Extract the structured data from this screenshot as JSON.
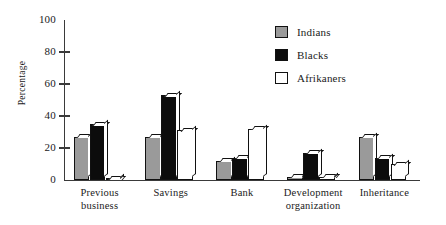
{
  "chart_data": {
    "type": "bar",
    "title": "",
    "xlabel": "",
    "ylabel": "Percentage",
    "ylim": [
      0,
      100
    ],
    "yticks": [
      0,
      20,
      40,
      60,
      80,
      100
    ],
    "grid": false,
    "legend_position": "top-right",
    "categories": [
      "Previous business",
      "Savings",
      "Bank",
      "Development organization",
      "Inheritance"
    ],
    "category_lines": [
      [
        "Previous",
        "business"
      ],
      [
        "Savings"
      ],
      [
        "Bank"
      ],
      [
        "Development",
        "organization"
      ],
      [
        "Inheritance"
      ]
    ],
    "series": [
      {
        "name": "Indians",
        "color": "#9a9a9a",
        "values": [
          27,
          27,
          12,
          2,
          27
        ]
      },
      {
        "name": "Blacks",
        "color": "#0c0c0c",
        "values": [
          35,
          53,
          14,
          17,
          14
        ]
      },
      {
        "name": "Afrikaners",
        "color": "#ffffff",
        "values": [
          1,
          31,
          32,
          2,
          10
        ]
      }
    ]
  },
  "axis": {
    "tick_labels": [
      "100",
      "80",
      "60",
      "40",
      "20",
      "0"
    ],
    "y_title": "Percentage"
  },
  "legend": {
    "items": [
      {
        "label": "Indians",
        "swatch": "#9a9a9a"
      },
      {
        "label": "Blacks",
        "swatch": "#0c0c0c"
      },
      {
        "label": "Afrikaners",
        "swatch": "#ffffff"
      }
    ]
  }
}
